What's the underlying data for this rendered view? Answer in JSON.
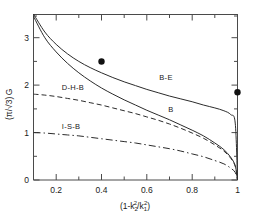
{
  "chart_data": {
    "type": "line",
    "title": "",
    "xlabel": "(1 - k2^2/k1^2)",
    "ylabel": "(pi/sqrt3)G",
    "xlim": [
      0.1,
      1.0
    ],
    "ylim": [
      0,
      3.5
    ],
    "grid": false,
    "legend_position": "inline-labels",
    "xticks": [
      0.2,
      0.4,
      0.6,
      0.8,
      1.0
    ],
    "xtick_labels": [
      "0.2",
      "0.4",
      "0.6",
      "0.8",
      "1"
    ],
    "yticks": [
      0,
      1,
      2,
      3
    ],
    "ytick_labels": [
      "0",
      "1",
      "2",
      "3"
    ],
    "series": [
      {
        "name": "B-E",
        "style": "solid",
        "label": "B-E",
        "x": [
          0.1,
          0.15,
          0.2,
          0.25,
          0.3,
          0.35,
          0.4,
          0.45,
          0.5,
          0.55,
          0.6,
          0.65,
          0.7,
          0.75,
          0.8,
          0.85,
          0.9,
          0.94,
          0.97,
          0.99,
          1.0
        ],
        "y": [
          3.52,
          3.12,
          2.86,
          2.66,
          2.5,
          2.37,
          2.26,
          2.16,
          2.07,
          1.99,
          1.91,
          1.84,
          1.77,
          1.71,
          1.65,
          1.58,
          1.52,
          1.46,
          1.38,
          1.2,
          0.0
        ]
      },
      {
        "name": "B",
        "style": "solid",
        "label": "B",
        "x": [
          0.1,
          0.15,
          0.2,
          0.25,
          0.3,
          0.35,
          0.4,
          0.45,
          0.5,
          0.55,
          0.6,
          0.65,
          0.7,
          0.75,
          0.8,
          0.85,
          0.9,
          0.94,
          0.97,
          0.99,
          1.0
        ],
        "y": [
          3.45,
          3.0,
          2.7,
          2.46,
          2.26,
          2.09,
          1.94,
          1.81,
          1.69,
          1.58,
          1.47,
          1.37,
          1.27,
          1.16,
          1.05,
          0.93,
          0.78,
          0.64,
          0.48,
          0.3,
          0.0
        ]
      },
      {
        "name": "D-H-B",
        "style": "dashed",
        "label": "D-H-B",
        "x": [
          0.1,
          0.15,
          0.2,
          0.25,
          0.3,
          0.35,
          0.4,
          0.45,
          0.5,
          0.55,
          0.6,
          0.65,
          0.7,
          0.75,
          0.8,
          0.85,
          0.9,
          0.94,
          0.97,
          0.99,
          1.0
        ],
        "y": [
          1.81,
          1.79,
          1.76,
          1.72,
          1.68,
          1.63,
          1.58,
          1.52,
          1.46,
          1.4,
          1.33,
          1.26,
          1.18,
          1.09,
          0.99,
          0.88,
          0.74,
          0.61,
          0.46,
          0.29,
          0.0
        ]
      },
      {
        "name": "I-S-B",
        "style": "dash-dot",
        "label": "I-S-B",
        "x": [
          0.1,
          0.15,
          0.2,
          0.25,
          0.3,
          0.35,
          0.4,
          0.45,
          0.5,
          0.55,
          0.6,
          0.65,
          0.7,
          0.75,
          0.8,
          0.85,
          0.9,
          0.94,
          0.97,
          0.99,
          1.0
        ],
        "y": [
          1.0,
          0.99,
          0.97,
          0.95,
          0.93,
          0.9,
          0.87,
          0.84,
          0.81,
          0.78,
          0.74,
          0.7,
          0.66,
          0.61,
          0.55,
          0.49,
          0.41,
          0.34,
          0.25,
          0.16,
          0.0
        ]
      }
    ],
    "points": [
      {
        "name": "data-point-1",
        "x": 0.4,
        "y": 2.5
      },
      {
        "name": "data-point-2",
        "x": 1.0,
        "y": 1.85
      }
    ],
    "annotations": [
      {
        "name": "label-be",
        "text": "B-E",
        "x": 0.655,
        "y": 2.1
      },
      {
        "name": "label-b",
        "text": "B",
        "x": 0.695,
        "y": 1.43
      },
      {
        "name": "label-dhb",
        "text": "D-H-B",
        "x": 0.225,
        "y": 1.9
      },
      {
        "name": "label-isb",
        "text": "I-S-B",
        "x": 0.225,
        "y": 1.08
      }
    ]
  },
  "axis": {
    "y_title_parts": {
      "open": "(",
      "pi": "π",
      "slash": "/",
      "root": "√3",
      "close": ")",
      "g": "G"
    },
    "x_title_parts": {
      "open": "(1-k",
      "sub1": "2",
      "sup1": "2",
      "mid": "/k",
      "sub2": "1",
      "sup2": "2",
      "close": ")"
    }
  }
}
